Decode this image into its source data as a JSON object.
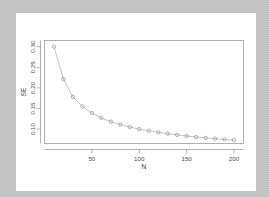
{
  "window": {
    "background_color": "#bfbfbf",
    "canvas_color": "#ffffff"
  },
  "chart_data": {
    "type": "scatter",
    "title": "",
    "subtitle": "",
    "xlabel": "N",
    "ylabel": "SE",
    "grid": false,
    "legend": "none",
    "marker": "open-circle",
    "line_style": "solid",
    "series_color": "#8a8a8a",
    "xlim": [
      0,
      210
    ],
    "ylim": [
      0.065,
      0.315
    ],
    "xticks": [
      50,
      100,
      150,
      200
    ],
    "xtick_labels": [
      "50",
      "100",
      "150",
      "200"
    ],
    "yticks": [
      0.1,
      0.15,
      0.2,
      0.25,
      0.3
    ],
    "ytick_labels": [
      "0.10",
      "0.15",
      "0.20",
      "0.25",
      "0.30"
    ],
    "x": [
      10,
      20,
      30,
      40,
      50,
      60,
      70,
      80,
      90,
      100,
      110,
      120,
      130,
      140,
      150,
      160,
      170,
      180,
      190,
      200
    ],
    "values": [
      0.3,
      0.221,
      0.178,
      0.155,
      0.139,
      0.127,
      0.118,
      0.111,
      0.105,
      0.1,
      0.0958,
      0.092,
      0.0888,
      0.0858,
      0.0832,
      0.0808,
      0.0786,
      0.0766,
      0.0748,
      0.0731
    ],
    "series": [
      {
        "name": "SE",
        "values": [
          0.3,
          0.221,
          0.178,
          0.155,
          0.139,
          0.127,
          0.118,
          0.111,
          0.105,
          0.1,
          0.0958,
          0.092,
          0.0888,
          0.0858,
          0.0832,
          0.0808,
          0.0786,
          0.0766,
          0.0748,
          0.0731
        ]
      }
    ]
  }
}
